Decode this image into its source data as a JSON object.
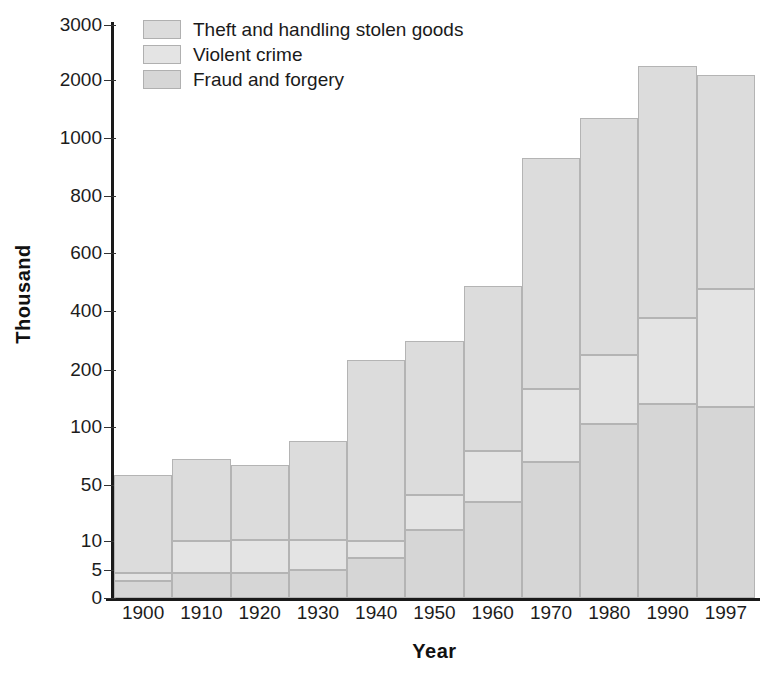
{
  "chart_data": {
    "type": "bar",
    "subtype": "stacked-bar",
    "title": "",
    "subtitle": "",
    "xlabel": "Year",
    "ylabel": "Thousand",
    "categories": [
      "1900",
      "1910",
      "1920",
      "1930",
      "1940",
      "1950",
      "1960",
      "1970",
      "1980",
      "1990",
      "1997"
    ],
    "series": [
      {
        "name": "Theft and handling stolen goods",
        "color": "#dcdcdc",
        "values": [
          54,
          62,
          56.5,
          77,
          223,
          257,
          406,
          763,
          1100,
          1875,
          1625
        ]
      },
      {
        "name": "Violent crime",
        "color": "#e4e4e4",
        "values": [
          1.5,
          5.5,
          6.5,
          6,
          3,
          25,
          41,
          97,
          145,
          235,
          340
        ]
      },
      {
        "name": "Fraud and forgery",
        "color": "#d6d6d6",
        "values": [
          3,
          4.5,
          4.5,
          5,
          7,
          18,
          38,
          70,
          105,
          140,
          135
        ]
      }
    ],
    "totals": [
      57,
      72,
      67,
      93,
      240,
      300,
      485,
      930,
      1350,
      2250,
      2100
    ],
    "ytick_labels": [
      "3000",
      "2000",
      "1000",
      "800",
      "600",
      "400",
      "200",
      "100",
      "50",
      "10",
      "5",
      "0"
    ],
    "ytick_values": [
      3000,
      2000,
      1000,
      800,
      600,
      400,
      200,
      100,
      50,
      10,
      5,
      0
    ],
    "ytick_pixels": [
      25,
      80,
      138,
      196,
      253,
      311,
      370,
      427,
      485,
      541,
      570,
      598
    ],
    "ylim": [
      0,
      3000
    ],
    "yscale": "piecewise-compressed",
    "grid": false,
    "legend_position": "top-left",
    "legend": [
      "Theft and handling stolen goods",
      "Violent crime",
      "Fraud and forgery"
    ]
  },
  "axes": {
    "y_title": "Thousand",
    "x_title": "Year"
  }
}
